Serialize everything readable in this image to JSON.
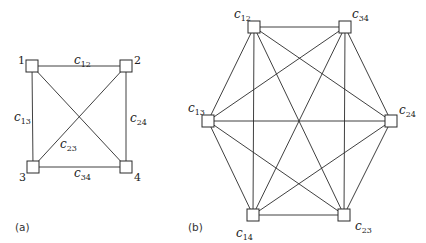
{
  "figure": {
    "panel_a": {
      "label": "(a)",
      "nodes": [
        {
          "id": "1",
          "label": "1"
        },
        {
          "id": "2",
          "label": "2"
        },
        {
          "id": "3",
          "label": "3"
        },
        {
          "id": "4",
          "label": "4"
        }
      ],
      "edge_labels": {
        "c12": {
          "base": "c",
          "sub": "12"
        },
        "c13": {
          "base": "c",
          "sub": "13"
        },
        "c23": {
          "base": "c",
          "sub": "23"
        },
        "c24": {
          "base": "c",
          "sub": "24"
        },
        "c34": {
          "base": "c",
          "sub": "34"
        }
      },
      "edges": [
        [
          "1",
          "2"
        ],
        [
          "1",
          "3"
        ],
        [
          "1",
          "4"
        ],
        [
          "2",
          "3"
        ],
        [
          "2",
          "4"
        ],
        [
          "3",
          "4"
        ]
      ]
    },
    "panel_b": {
      "label": "(b)",
      "nodes": [
        {
          "id": "c12",
          "base": "c",
          "sub": "12"
        },
        {
          "id": "c34",
          "base": "c",
          "sub": "34"
        },
        {
          "id": "c13",
          "base": "c",
          "sub": "13"
        },
        {
          "id": "c24",
          "base": "c",
          "sub": "24"
        },
        {
          "id": "c14",
          "base": "c",
          "sub": "14"
        },
        {
          "id": "c23",
          "base": "c",
          "sub": "23"
        }
      ],
      "edges": "complete graph K6 — every pair of the six nodes connected"
    }
  }
}
